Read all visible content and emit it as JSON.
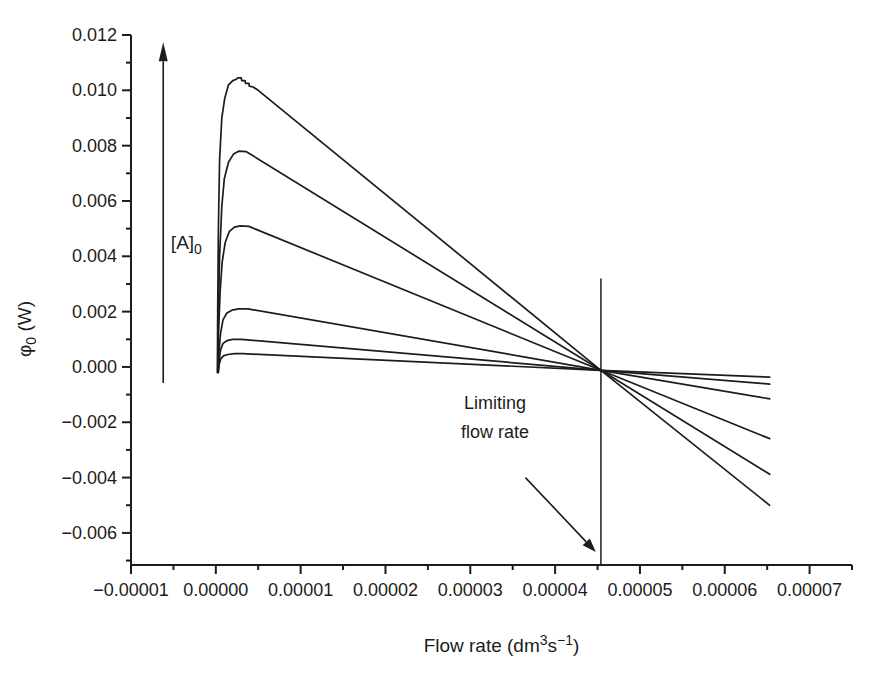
{
  "figure": {
    "background": "#ffffff",
    "ink": "#1c1c1c"
  },
  "chart_data": {
    "type": "line",
    "title": "",
    "xlabel": "Flow rate (dm³s⁻¹)",
    "ylabel": "φ₀ (W)",
    "xlabel_parts": [
      {
        "t": "Flow rate (dm"
      },
      {
        "t": "3",
        "sup": true
      },
      {
        "t": "s"
      },
      {
        "t": "−1",
        "sup": true
      },
      {
        "t": ")"
      }
    ],
    "ylabel_parts": [
      {
        "t": "φ"
      },
      {
        "t": "0",
        "sub": true
      },
      {
        "t": " (W)"
      }
    ],
    "xlim": [
      -1e-05,
      7.5e-05
    ],
    "ylim": [
      -0.00716,
      0.012
    ],
    "grid": false,
    "legend": null,
    "x_ticks": {
      "major": [
        {
          "v": -1e-05,
          "label": "−0.00001"
        },
        {
          "v": 0.0,
          "label": "0.00000"
        },
        {
          "v": 1e-05,
          "label": "0.00001"
        },
        {
          "v": 2e-05,
          "label": "0.00002"
        },
        {
          "v": 3e-05,
          "label": "0.00003"
        },
        {
          "v": 4e-05,
          "label": "0.00004"
        },
        {
          "v": 5e-05,
          "label": "0.00005"
        },
        {
          "v": 6e-05,
          "label": "0.00006"
        },
        {
          "v": 7e-05,
          "label": "0.00007"
        }
      ],
      "minor": [
        -5e-06,
        5e-06,
        1.5e-05,
        2.5e-05,
        3.5e-05,
        4.5e-05,
        5.5e-05,
        6.5e-05,
        7.5e-05
      ]
    },
    "y_ticks": {
      "major": [
        {
          "v": 0.012,
          "label": "0.012"
        },
        {
          "v": 0.01,
          "label": "0.010"
        },
        {
          "v": 0.008,
          "label": "0.008"
        },
        {
          "v": 0.006,
          "label": "0.006"
        },
        {
          "v": 0.004,
          "label": "0.004"
        },
        {
          "v": 0.002,
          "label": "0.002"
        },
        {
          "v": 0.0,
          "label": "0.000"
        },
        {
          "v": -0.002,
          "label": "−0.002"
        },
        {
          "v": -0.004,
          "label": "−0.004"
        },
        {
          "v": -0.006,
          "label": "−0.006"
        }
      ],
      "minor": [
        0.011,
        0.009,
        0.007,
        0.005,
        0.003,
        0.001,
        -0.001,
        -0.003,
        -0.005,
        -0.007
      ]
    },
    "series": [
      {
        "peak": 0.0104,
        "points": [
          [
            1.8e-07,
            -0.0002
          ],
          [
            2.2e-07,
            0.002
          ],
          [
            3e-07,
            0.005
          ],
          [
            4.5e-07,
            0.0075
          ],
          [
            7e-07,
            0.009
          ],
          [
            1.05e-06,
            0.0097
          ],
          [
            1.5e-06,
            0.0102
          ],
          [
            2e-06,
            0.01035
          ],
          [
            2.4e-06,
            0.0104
          ],
          [
            2.6e-06,
            0.01045
          ],
          [
            3e-06,
            0.01045
          ],
          [
            3.05e-06,
            0.01035
          ],
          [
            3.45e-06,
            0.01035
          ],
          [
            3.5e-06,
            0.01025
          ],
          [
            3.9e-06,
            0.01025
          ],
          [
            3.95e-06,
            0.01015
          ],
          [
            4.4e-06,
            0.01012
          ],
          [
            5e-06,
            0.01
          ],
          [
            4.54e-05,
            -0.00012
          ],
          [
            6.53e-05,
            -0.005
          ]
        ]
      },
      {
        "peak": 0.0078,
        "points": [
          [
            2.2e-07,
            -0.0002
          ],
          [
            3e-07,
            0.002
          ],
          [
            4.5e-07,
            0.004
          ],
          [
            7e-07,
            0.0058
          ],
          [
            1e-06,
            0.0068
          ],
          [
            1.5e-06,
            0.0074
          ],
          [
            2.1e-06,
            0.0077
          ],
          [
            2.7e-06,
            0.0078
          ],
          [
            3.6e-06,
            0.00778
          ],
          [
            4.54e-05,
            -0.00012
          ],
          [
            6.53e-05,
            -0.00388
          ]
        ]
      },
      {
        "peak": 0.0051,
        "points": [
          [
            2.4e-07,
            -0.0002
          ],
          [
            3.2e-07,
            0.0012
          ],
          [
            5e-07,
            0.0027
          ],
          [
            7.5e-07,
            0.0038
          ],
          [
            1.1e-06,
            0.0045
          ],
          [
            1.6e-06,
            0.0049
          ],
          [
            2.2e-06,
            0.00505
          ],
          [
            2.9e-06,
            0.0051
          ],
          [
            3.9e-06,
            0.00508
          ],
          [
            4.54e-05,
            -0.00012
          ],
          [
            6.53e-05,
            -0.00259
          ]
        ]
      },
      {
        "peak": 0.0021,
        "points": [
          [
            2.6e-07,
            -0.0002
          ],
          [
            3.6e-07,
            0.0005
          ],
          [
            5.5e-07,
            0.0012
          ],
          [
            8.5e-07,
            0.0017
          ],
          [
            1.3e-06,
            0.00195
          ],
          [
            1.9e-06,
            0.00205
          ],
          [
            2.7e-06,
            0.0021
          ],
          [
            3.8e-06,
            0.0021
          ],
          [
            4.54e-05,
            -0.00012
          ],
          [
            6.53e-05,
            -0.00115
          ]
        ]
      },
      {
        "peak": 0.001,
        "points": [
          [
            2.8e-07,
            -0.0002
          ],
          [
            3.8e-07,
            0.0002
          ],
          [
            5.5e-07,
            0.0006
          ],
          [
            8.5e-07,
            0.00085
          ],
          [
            1.3e-06,
            0.00095
          ],
          [
            2e-06,
            0.001
          ],
          [
            3e-06,
            0.001
          ],
          [
            4.54e-05,
            -0.00012
          ],
          [
            6.53e-05,
            -0.00062
          ]
        ]
      },
      {
        "peak": 0.00048,
        "points": [
          [
            3e-07,
            -0.0002
          ],
          [
            4e-07,
            0.0001
          ],
          [
            6e-07,
            0.0003
          ],
          [
            9e-07,
            0.0004
          ],
          [
            1.4e-06,
            0.00045
          ],
          [
            2.2e-06,
            0.00048
          ],
          [
            3.2e-06,
            0.00048
          ],
          [
            4.54e-05,
            -0.00012
          ],
          [
            6.53e-05,
            -0.00037
          ]
        ]
      }
    ],
    "crossing_point": {
      "x": 4.54e-05,
      "y": -0.00012
    },
    "limiting_flow_rate": 4.54e-05
  },
  "annotations": {
    "a0": {
      "label": "[A]₀",
      "label_parts": [
        {
          "t": "[A]"
        },
        {
          "t": "0",
          "sub": true
        }
      ],
      "label_pos": [
        -5.3e-06,
        0.0045
      ],
      "arrow": {
        "x": -6.2e-06,
        "y_from": -0.00058,
        "y_to": 0.01174
      }
    },
    "limiting": {
      "text_line1": "Limiting",
      "text_line2": "flow rate",
      "line1_pos": [
        3.29e-05,
        -0.0013
      ],
      "line2_pos": [
        3.29e-05,
        -0.00235
      ],
      "arrow": {
        "from": [
          3.65e-05,
          -0.004
        ],
        "to": [
          4.48e-05,
          -0.00669
        ]
      },
      "vline": {
        "x": 4.54e-05,
        "y_from": -0.00716,
        "y_to": 0.0032
      }
    }
  }
}
